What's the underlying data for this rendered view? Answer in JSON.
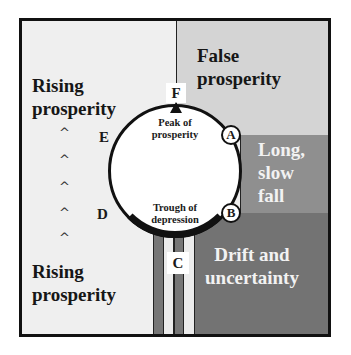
{
  "diagram": {
    "regions": {
      "top_left": "Rising",
      "top_left_2": "prosperity",
      "bottom_left": "Rising",
      "bottom_left_2": "prosperity",
      "false_1": "False",
      "false_2": "prosperity",
      "long_1": "Long,",
      "long_2": "slow",
      "long_3": "fall",
      "drift_1": "Drift and",
      "drift_2": "uncertainty"
    },
    "circle": {
      "peak_1": "Peak of",
      "peak_2": "prosperity",
      "trough_1": "Trough of",
      "trough_2": "depression"
    },
    "points": {
      "A": "A",
      "B": "B",
      "C": "C",
      "D": "D",
      "E": "E",
      "F": "F"
    },
    "arrows": [
      "^",
      "^",
      "^",
      "^",
      "^"
    ],
    "colors": {
      "frame": "#111111",
      "rising": "#efefef",
      "false_prosperity": "#d4d4d4",
      "long_slow_fall": "#8f8f8f",
      "drift": "#737373"
    }
  }
}
